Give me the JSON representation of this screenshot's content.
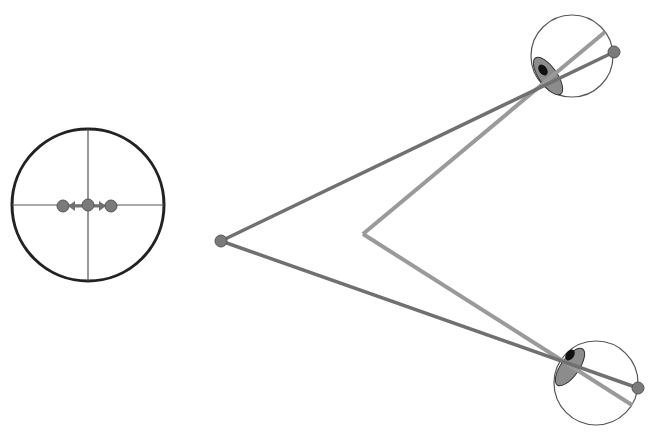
{
  "diagram": {
    "canvas": {
      "width": 656,
      "height": 437,
      "background": "#ffffff"
    },
    "colors": {
      "outline_dark": "#222222",
      "outline_thin": "#555555",
      "crosshair": "#555555",
      "near_lines": "#707070",
      "far_lines": "#9a9a9a",
      "dot_fill": "#7a7a7a",
      "dot_stroke": "#555555",
      "iris_fill": "#8c8c8c",
      "pupil_fill": "#111111"
    },
    "target_display": {
      "center": [
        88,
        205
      ],
      "radius": 76,
      "crosshair": true,
      "center_dot": [
        88,
        205
      ],
      "left_dot": [
        63,
        206
      ],
      "right_dot": [
        111,
        206
      ],
      "dot_radius": 6,
      "arrows": [
        "left",
        "right"
      ]
    },
    "near_target": {
      "point": [
        221,
        241
      ],
      "radius": 6
    },
    "far_vertex": {
      "point": [
        363,
        234
      ]
    },
    "eyes": [
      {
        "name": "top-eye",
        "center": [
          572,
          56
        ],
        "radius": 41,
        "iris_center": [
          548,
          76
        ],
        "iris_rx": 9,
        "iris_ry": 22,
        "iris_rotate": -35,
        "pupil_center": [
          543,
          70
        ],
        "fovea_dot": [
          614,
          52
        ],
        "far_line_end": [
          605,
          32
        ]
      },
      {
        "name": "bottom-eye",
        "center": [
          596,
          383
        ],
        "radius": 42,
        "iris_center": [
          570,
          367
        ],
        "iris_rx": 9,
        "iris_ry": 22,
        "iris_rotate": 35,
        "pupil_center": [
          570,
          355
        ],
        "fovea_dot": [
          638,
          388
        ],
        "far_line_end": [
          632,
          405
        ]
      }
    ]
  }
}
